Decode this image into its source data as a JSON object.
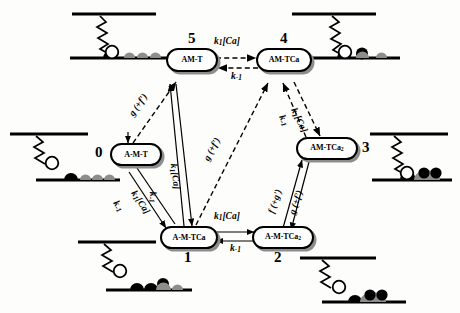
{
  "figure": {
    "background_color": "#fdfdfb",
    "line_color": "#000000",
    "shadow_color": "#8d8d8d",
    "ca_filled_color": "#000000",
    "ca_gray_color": "#8d8d8d",
    "head_open_color": "#ffffff"
  },
  "states": [
    {
      "id": "state-0",
      "number": "0",
      "label_html": "A-M-T",
      "label_text": "A-M-T"
    },
    {
      "id": "state-1",
      "number": "1",
      "label_html": "A-M-TCa",
      "label_text": "A-M-TCa"
    },
    {
      "id": "state-2",
      "number": "2",
      "label_html": "A-M-TCa",
      "label_sub": "2",
      "label_text": "A-M-TCa2"
    },
    {
      "id": "state-3",
      "number": "3",
      "label_html": "AM-TCa",
      "label_sub": "2",
      "label_text": "AM-TCa2"
    },
    {
      "id": "state-4",
      "number": "4",
      "label_html": "AM-TCa",
      "label_text": "AM-TCa"
    },
    {
      "id": "state-5",
      "number": "5",
      "label_html": "AM-T",
      "label_text": "AM-T"
    }
  ],
  "transitions": [
    {
      "id": "t-5-4-fwd",
      "from": "5",
      "to": "4",
      "label_main": "k",
      "label_sub": "1",
      "label_tail": "[Ca]",
      "label_text": "k1[Ca]",
      "style": "dashed"
    },
    {
      "id": "t-4-5-rev",
      "from": "4",
      "to": "5",
      "label_main": "k",
      "label_sub": "-1",
      "label_tail": "",
      "label_text": "k-1",
      "style": "dashed"
    },
    {
      "id": "t-1-2-fwd",
      "from": "1",
      "to": "2",
      "label_main": "k",
      "label_sub": "1",
      "label_tail": "[Ca]",
      "label_text": "k1[Ca]",
      "style": "solid"
    },
    {
      "id": "t-2-1-rev",
      "from": "2",
      "to": "1",
      "label_main": "k",
      "label_sub": "-1",
      "label_tail": "",
      "label_text": "k-1",
      "style": "solid"
    },
    {
      "id": "t-1-5-fwd",
      "from": "1",
      "to": "5",
      "label_main": "k",
      "label_sub": "1",
      "label_tail": "[Ca]",
      "label_text": "k1[Ca]",
      "style": "solid"
    },
    {
      "id": "t-5-1-rev",
      "from": "5",
      "to": "1",
      "label_main": "k",
      "label_sub": "-1",
      "label_tail": "",
      "label_text": "k-1",
      "style": "solid"
    },
    {
      "id": "t-4-3-fwd",
      "from": "4",
      "to": "3",
      "label_main": "k",
      "label_sub": "1",
      "label_tail": "[Ca]",
      "label_text": "k1[Ca]",
      "style": "dashed"
    },
    {
      "id": "t-3-4-rev",
      "from": "3",
      "to": "4",
      "label_main": "k",
      "label_sub": "-1",
      "label_tail": "",
      "label_text": "k-1",
      "style": "dashed"
    },
    {
      "id": "t-0-5",
      "from": "0",
      "to": "5",
      "label_text": "g (+f')",
      "style": "dashed"
    },
    {
      "id": "t-1-4",
      "from": "1",
      "to": "4",
      "label_text": "g (+f')",
      "style": "dashed"
    },
    {
      "id": "t-2-3-g",
      "from": "2",
      "to": "3",
      "label_text": "g (+f')",
      "style": "solid"
    },
    {
      "id": "t-3-2-f",
      "from": "3",
      "to": "2",
      "label_text": "f (+g')",
      "style": "solid"
    },
    {
      "id": "t-0-1",
      "from": "0",
      "to": "1",
      "label_main": "k",
      "label_sub": "1",
      "label_tail": "[Ca]",
      "label_text": "k1[Ca]",
      "style": "solid"
    },
    {
      "id": "t-1-0",
      "from": "1",
      "to": "0",
      "label_main": "k",
      "label_sub": "-1",
      "label_tail": "",
      "label_text": "k-1",
      "style": "solid"
    }
  ],
  "rate_labels": {
    "k1ca": "k",
    "k1ca_sub": "1",
    "k1ca_tail": "[Ca]",
    "kminus1": "k",
    "kminus1_sub": "-1",
    "g_plus_f": "g (+f')",
    "f_plus_g": "f (+g')"
  },
  "cartoons": [
    {
      "id": "cartoon-top-left",
      "state_ref": "5",
      "attached": false,
      "ca_filled": 0,
      "ca_gray": 3,
      "description": "detached myosin head, no Ca bound on troponin"
    },
    {
      "id": "cartoon-top-right",
      "state_ref": "4",
      "attached": false,
      "ca_filled": 1,
      "ca_gray": 2,
      "description": "detached myosin head, one Ca bound"
    },
    {
      "id": "cartoon-mid-left",
      "state_ref": "0",
      "attached": false,
      "ca_filled": 0,
      "ca_gray": 3,
      "description": "detached head, troponin without Ca"
    },
    {
      "id": "cartoon-mid-right",
      "state_ref": "3",
      "attached": true,
      "ca_filled": 2,
      "ca_gray": 0,
      "description": "attached head, two Ca bound"
    },
    {
      "id": "cartoon-bottom-left",
      "state_ref": "1",
      "attached": true,
      "ca_filled": 1,
      "ca_gray": 2,
      "description": "attached head, one Ca bound"
    },
    {
      "id": "cartoon-bottom-right",
      "state_ref": "2",
      "attached": false,
      "ca_filled": 2,
      "ca_gray": 1,
      "description": "detached head, two Ca bound"
    }
  ]
}
